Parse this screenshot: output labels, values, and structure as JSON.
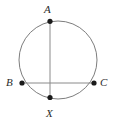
{
  "figure": {
    "kind": "geometry-diagram",
    "width": 114,
    "height": 121,
    "background_color": "#ffffff"
  },
  "colors": {
    "circle_stroke": "#6e6e6e",
    "chord_stroke": "#8a8a8a",
    "point_fill": "#1a1a1a",
    "label_color": "#2b2b2b"
  },
  "circle": {
    "name": "circle",
    "cx": 58,
    "cy": 60,
    "r": 39,
    "stroke_width": 0.9
  },
  "points": [
    {
      "id": "A",
      "label": "A",
      "cx": 50.0,
      "cy": 21.3,
      "r": 2.6,
      "label_x": 44,
      "label_y": 4
    },
    {
      "id": "B",
      "label": "B",
      "cx": 22.0,
      "cy": 83.0,
      "r": 2.6,
      "label_x": 6,
      "label_y": 77
    },
    {
      "id": "C",
      "label": "C",
      "cx": 94.0,
      "cy": 83.0,
      "r": 2.6,
      "label_x": 100,
      "label_y": 77
    },
    {
      "id": "X",
      "label": "X",
      "cx": 50.0,
      "cy": 97.5,
      "r": 2.6,
      "label_x": 46,
      "label_y": 108
    }
  ],
  "chords": [
    {
      "id": "AX",
      "from": "A",
      "to": "X",
      "x1": 50.0,
      "y1": 21.3,
      "x2": 50.0,
      "y2": 97.5,
      "stroke_width": 1.0
    },
    {
      "id": "BC",
      "from": "B",
      "to": "C",
      "x1": 22.0,
      "y1": 83.0,
      "x2": 94.0,
      "y2": 83.0,
      "stroke_width": 1.0
    }
  ],
  "intersection": {
    "x": 50.0,
    "y": 83.0
  }
}
